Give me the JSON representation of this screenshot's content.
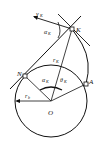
{
  "diagram": {
    "points": {
      "K": "K",
      "N": "N",
      "A": "A",
      "O": "O"
    },
    "labels": {
      "velocity": "v",
      "velocity_sub": "K",
      "pressure_angle": "α",
      "pressure_angle_sub": "K",
      "radius_K": "r",
      "radius_K_sub": "K",
      "roll_angle": "α",
      "roll_angle_sub": "K",
      "theta": "θ",
      "theta_sub": "K",
      "base_radius": "r",
      "base_radius_sub": "b"
    }
  }
}
